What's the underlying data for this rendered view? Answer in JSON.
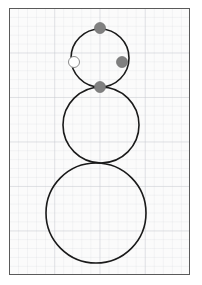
{
  "figure": {
    "title": "",
    "background_color": "#fbfbfb",
    "page_color": "#ffffff",
    "frame_color": "#5a5a5a",
    "grid_visible": true,
    "grid_minor_color": "#d0d2d8",
    "grid_major_color": "#c4c6cd",
    "grid_minor_spacing": 9,
    "grid_major_spacing": 45
  },
  "chart_data": {
    "type": "scatter",
    "title": "",
    "subtitle": "",
    "xlabel": "",
    "ylabel": "",
    "xlim": [
      0,
      181
    ],
    "ylim": [
      0,
      267
    ],
    "grid": true,
    "legend": "none",
    "annotations": [],
    "shapes": [
      {
        "name": "head-circle",
        "kind": "circle",
        "cx": 99,
        "cy": 57,
        "r": 29,
        "stroke": "#1a1a1a",
        "stroke_width": 1.6,
        "fill": "none"
      },
      {
        "name": "torso-circle",
        "kind": "circle",
        "cx": 100,
        "cy": 124,
        "r": 38,
        "stroke": "#1a1a1a",
        "stroke_width": 1.6,
        "fill": "none"
      },
      {
        "name": "base-circle",
        "kind": "circle",
        "cx": 95,
        "cy": 212,
        "r": 50,
        "stroke": "#1a1a1a",
        "stroke_width": 1.6,
        "fill": "none"
      }
    ],
    "series": [
      {
        "name": "filled-markers",
        "marker": "circle-filled",
        "color": "#808080",
        "marker_size": 11,
        "points": [
          {
            "label": "top",
            "x": 99,
            "y": 27
          },
          {
            "label": "right",
            "x": 121,
            "y": 61
          },
          {
            "label": "bottom",
            "x": 99,
            "y": 86
          }
        ]
      },
      {
        "name": "open-markers",
        "marker": "circle-open",
        "color": "#ffffff",
        "edge_color": "#8a8a8a",
        "marker_size": 11,
        "points": [
          {
            "label": "left",
            "x": 73,
            "y": 61
          }
        ]
      }
    ]
  }
}
